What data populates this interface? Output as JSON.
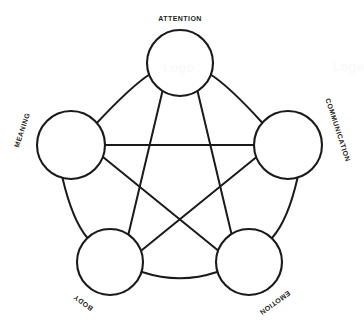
{
  "diagram": {
    "type": "pentagram-network",
    "stroke_color": "#1a1a1a",
    "fill_color": "#ffffff",
    "background_color": "#ffffff",
    "label_color": "#231f20",
    "nodes": [
      {
        "id": "attention",
        "label": "ATTENTION",
        "position": "top",
        "cx": 180,
        "cy": 63,
        "r": 33,
        "label_rotation": 0,
        "label_x": 180,
        "label_y": 18
      },
      {
        "id": "communication",
        "label": "COMMUNICATION",
        "position": "right",
        "cx": 288,
        "cy": 145,
        "r": 34,
        "label_rotation": 72,
        "label_x": 338,
        "label_y": 130
      },
      {
        "id": "emotion",
        "label": "EMOTION",
        "position": "bottom-right",
        "cx": 249,
        "cy": 262,
        "r": 33,
        "label_rotation": 144,
        "label_x": 275,
        "label_y": 303
      },
      {
        "id": "body",
        "label": "BODY",
        "position": "bottom-left",
        "cx": 110,
        "cy": 262,
        "r": 33,
        "label_rotation": 216,
        "label_x": 83,
        "label_y": 303
      },
      {
        "id": "meaning",
        "label": "MEANING",
        "position": "left",
        "cx": 71,
        "cy": 145,
        "r": 34,
        "label_rotation": 288,
        "label_x": 22,
        "label_y": 130
      }
    ],
    "outer_links": [
      {
        "from": "meaning",
        "to": "attention",
        "style": "arc"
      },
      {
        "from": "attention",
        "to": "communication",
        "style": "arc"
      },
      {
        "from": "communication",
        "to": "emotion",
        "style": "arc"
      },
      {
        "from": "emotion",
        "to": "body",
        "style": "arc"
      },
      {
        "from": "body",
        "to": "meaning",
        "style": "arc"
      }
    ],
    "star_links": [
      {
        "from": "attention",
        "to": "emotion",
        "style": "straight"
      },
      {
        "from": "emotion",
        "to": "meaning",
        "style": "straight"
      },
      {
        "from": "meaning",
        "to": "communication",
        "style": "straight"
      },
      {
        "from": "communication",
        "to": "body",
        "style": "straight"
      },
      {
        "from": "body",
        "to": "attention",
        "style": "straight"
      }
    ],
    "watermarks": [
      {
        "id": "watermark-center",
        "text": "Logo",
        "x": 163,
        "y": 62
      },
      {
        "id": "watermark-corner",
        "text": "Logo",
        "x": 333,
        "y": 61
      }
    ]
  }
}
